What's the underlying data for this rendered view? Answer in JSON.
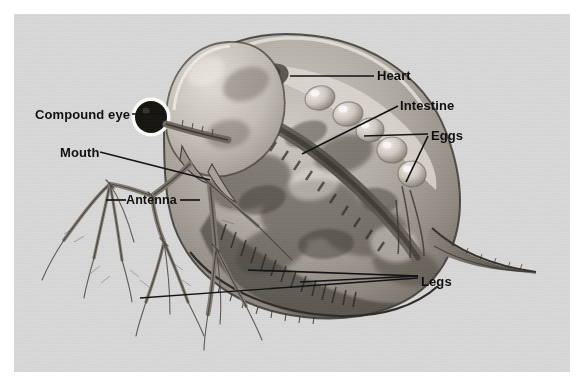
{
  "figure": {
    "style": "grayscale photomicrograph illustration",
    "plate_background_color": "#d9d9d9",
    "page_background_color": "#ffffff",
    "label_color": "#0d0d0d",
    "leader_line_color": "#111111"
  },
  "labels": [
    {
      "id": "compound-eye",
      "text": "Compound eye",
      "x": 35,
      "y": 94,
      "leader": "right"
    },
    {
      "id": "mouth",
      "text": "Mouth",
      "x": 60,
      "y": 133,
      "leader": "right"
    },
    {
      "id": "antenna",
      "text": "Antenna",
      "x": 126,
      "y": 196,
      "leader": "both"
    },
    {
      "id": "heart",
      "text": "Heart",
      "x": 377,
      "y": 69,
      "leader": "left"
    },
    {
      "id": "intestine",
      "text": "Intestine",
      "x": 400,
      "y": 99,
      "leader": "left"
    },
    {
      "id": "eggs",
      "text": "Eggs",
      "x": 431,
      "y": 129,
      "leader": "left"
    },
    {
      "id": "legs",
      "text": "Legs",
      "x": 421,
      "y": 275,
      "leader": "left"
    }
  ],
  "anatomy_parts": [
    "compound eye",
    "mouth",
    "antenna",
    "heart",
    "intestine",
    "eggs",
    "legs",
    "carapace",
    "tail spine",
    "brood chamber"
  ]
}
